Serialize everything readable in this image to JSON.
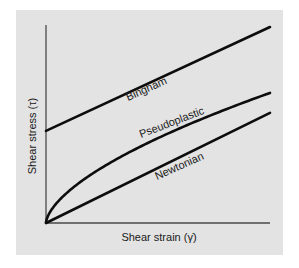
{
  "chart_data": {
    "type": "line",
    "title": "",
    "xlabel": "Shear strain (γ̇)",
    "ylabel": "Shear stress (τ)",
    "xlim": [
      0,
      10
    ],
    "ylim": [
      0,
      10
    ],
    "grid": false,
    "ticks": false,
    "legend": "inline labels along curves",
    "series": [
      {
        "name": "Bingham",
        "model": "linear with yield stress",
        "x": [
          0,
          10
        ],
        "y": [
          4.65,
          9.9
        ]
      },
      {
        "name": "Pseudoplastic",
        "model": "power law, n < 1",
        "x": [
          0,
          0.25,
          0.5,
          1,
          2,
          3,
          4,
          5,
          6,
          7,
          8,
          9,
          10
        ],
        "y": [
          0,
          0.6,
          1.04,
          1.59,
          2.44,
          3.12,
          3.72,
          4.26,
          4.76,
          5.24,
          5.68,
          6.14,
          6.57
        ]
      },
      {
        "name": "Newtonian",
        "model": "linear through origin",
        "x": [
          0,
          10
        ],
        "y": [
          0,
          5.56
        ]
      }
    ],
    "annotations": [
      "Bingham",
      "Pseudoplastic",
      "Newtonian"
    ]
  },
  "labels": {
    "x_axis": "Shear strain (γ̇)",
    "y_axis": "Shear stress (τ)",
    "bingham": "Bingham",
    "pseudoplastic": "Pseudoplastic",
    "newtonian": "Newtonian"
  },
  "colors": {
    "background": "#e3e3e3",
    "curve": "#0d0d0d",
    "axis": "#4a4a4a"
  }
}
